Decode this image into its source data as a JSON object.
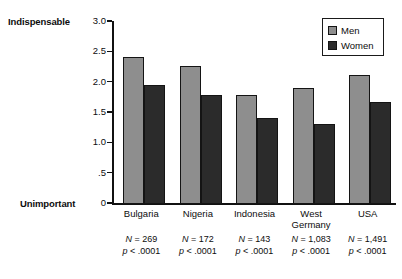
{
  "chart_data": {
    "type": "bar",
    "title": "",
    "xlabel": "",
    "ylabel": "",
    "ylim": [
      0,
      3.0
    ],
    "grid": false,
    "legend_position": "top-right",
    "categories": [
      "Bulgaria",
      "Nigeria",
      "Indonesia",
      "West\nGermany",
      "USA"
    ],
    "series": [
      {
        "name": "Men",
        "color": "#8e8e8e",
        "values": [
          2.42,
          2.27,
          1.79,
          1.92,
          2.12
        ]
      },
      {
        "name": "Women",
        "color": "#2b2b2b",
        "values": [
          1.96,
          1.79,
          1.41,
          1.32,
          1.68
        ]
      }
    ],
    "y_ticks": [
      "3.0",
      "2.5",
      "2.0",
      "1.5",
      "1.0",
      ".5",
      "0"
    ],
    "y_tick_values": [
      3.0,
      2.5,
      2.0,
      1.5,
      1.0,
      0.5,
      0
    ],
    "scale_anchor_high": "Indispensable",
    "scale_anchor_low": "Unimportant",
    "annotations": [
      {
        "n": "N = 269",
        "p": "p < .0001"
      },
      {
        "n": "N = 172",
        "p": "p < .0001"
      },
      {
        "n": "N = 143",
        "p": "p < .0001"
      },
      {
        "n": "N = 1,083",
        "p": "p < .0001"
      },
      {
        "n": "N = 1,491",
        "p": "p < .0001"
      }
    ]
  },
  "legend": {
    "items": [
      {
        "label": "Men",
        "color": "#8e8e8e"
      },
      {
        "label": "Women",
        "color": "#2b2b2b"
      }
    ]
  }
}
